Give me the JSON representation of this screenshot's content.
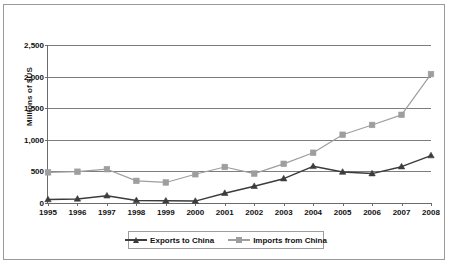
{
  "chart_data": {
    "type": "line",
    "title": "",
    "xlabel": "",
    "ylabel": "Millions of $US",
    "categories": [
      "1995",
      "1996",
      "1997",
      "1998",
      "1999",
      "2000",
      "2001",
      "2002",
      "2003",
      "2004",
      "2005",
      "2006",
      "2007",
      "2008"
    ],
    "ylim": [
      0,
      2500
    ],
    "yticks": [
      0,
      500,
      1000,
      1500,
      2000,
      2500
    ],
    "ytick_labels": [
      "0",
      "500",
      "1,000",
      "1,500",
      "2,000",
      "2,500"
    ],
    "grid": true,
    "legend_position": "bottom",
    "series": [
      {
        "name": "Exports to China",
        "marker": "triangle",
        "color": "#3c3c3c",
        "values": [
          55,
          65,
          115,
          40,
          35,
          30,
          155,
          265,
          385,
          580,
          490,
          465,
          575,
          750
        ]
      },
      {
        "name": "Imports from China",
        "marker": "square",
        "color": "#9e9e9e",
        "values": [
          485,
          495,
          535,
          350,
          325,
          455,
          570,
          465,
          620,
          795,
          1080,
          1235,
          1395,
          2040
        ]
      }
    ]
  },
  "legend": {
    "items": [
      {
        "label": "Exports to China"
      },
      {
        "label": "Imports from China"
      }
    ]
  },
  "colors": {
    "exports": "#3c3c3c",
    "imports": "#9e9e9e",
    "grid": "#7d7d7d",
    "axis": "#6b6b6b",
    "frame": "#9a9a9a",
    "text": "#111111"
  }
}
